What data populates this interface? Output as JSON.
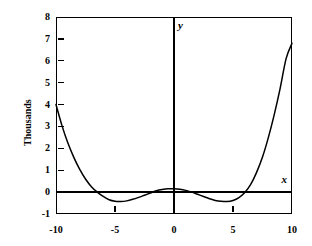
{
  "chart_data": {
    "type": "line",
    "title": "",
    "subtitle": "",
    "xlabel": "x",
    "ylabel": "Thousands",
    "yaxis_name": "y",
    "xaxis_name": "x",
    "xlim": [
      -10,
      10
    ],
    "ylim": [
      -1,
      8
    ],
    "xticks": [
      -10,
      -5,
      0,
      5,
      10
    ],
    "xtick_labels": [
      "-10",
      "-5",
      "0",
      "5",
      "10"
    ],
    "yticks": [
      -1,
      0,
      1,
      2,
      3,
      4,
      5,
      6,
      7,
      8
    ],
    "ytick_labels": [
      "-1",
      "0",
      "1",
      "2",
      "3",
      "4",
      "5",
      "6",
      "7",
      "8"
    ],
    "grid": false,
    "legend": "none",
    "units_note": "Thousands",
    "series": [
      {
        "name": "curve",
        "color": "#000000",
        "x": [
          -10,
          -9.5,
          -9,
          -8.5,
          -8,
          -7.5,
          -7,
          -6.5,
          -6,
          -5.5,
          -5,
          -4.5,
          -4,
          -3.5,
          -3,
          -2.5,
          -2,
          -1.5,
          -1,
          -0.5,
          0,
          0.5,
          1,
          1.5,
          2,
          2.5,
          3,
          3.5,
          4,
          4.5,
          5,
          5.5,
          6,
          6.5,
          7,
          7.5,
          8,
          8.5,
          9,
          9.5,
          10
        ],
        "y": [
          4.0,
          3.05,
          2.25,
          1.6,
          1.05,
          0.6,
          0.25,
          0.0,
          -0.2,
          -0.35,
          -0.42,
          -0.43,
          -0.4,
          -0.33,
          -0.24,
          -0.14,
          -0.04,
          0.06,
          0.12,
          0.15,
          0.15,
          0.13,
          0.08,
          0.0,
          -0.1,
          -0.2,
          -0.3,
          -0.38,
          -0.42,
          -0.43,
          -0.38,
          -0.25,
          -0.02,
          0.35,
          0.9,
          1.6,
          2.5,
          3.55,
          4.75,
          6.1,
          6.8
        ]
      }
    ],
    "annotations": [
      {
        "text": "y",
        "role": "vertical-axis-name",
        "x": 0,
        "y": 7.6
      },
      {
        "text": "x",
        "role": "horizontal-axis-name",
        "x": 9.1,
        "y": 0.45
      }
    ]
  },
  "figure": {
    "background": "#ffffff",
    "axis_color": "#000000",
    "curve_color": "#000000"
  }
}
